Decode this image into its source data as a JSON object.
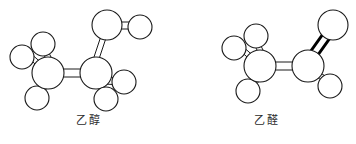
{
  "figure": {
    "background_color": "#ffffff",
    "line_color": "#1a1a1a",
    "atom_fill_color": "#ffffff",
    "bold_bond_color": "#000000",
    "width": 356,
    "height": 144
  },
  "molecules": [
    {
      "id": "ethanol",
      "caption": "乙醇",
      "formula": "CH3CH2OH",
      "model_type": "ball-and-stick",
      "atoms": [
        {
          "label": "H",
          "role": "methyl-hydrogen",
          "cx": 22,
          "cy": 57,
          "r": 12
        },
        {
          "label": "H",
          "role": "methyl-hydrogen",
          "cx": 43,
          "cy": 44,
          "r": 12
        },
        {
          "label": "H",
          "role": "methyl-hydrogen",
          "cx": 37,
          "cy": 98,
          "r": 12
        },
        {
          "label": "C",
          "role": "methyl-carbon",
          "cx": 48,
          "cy": 73,
          "r": 16
        },
        {
          "label": "C",
          "role": "methylene-carbon",
          "cx": 96,
          "cy": 73,
          "r": 16
        },
        {
          "label": "H",
          "role": "methylene-hydrogen",
          "cx": 124,
          "cy": 82,
          "r": 12
        },
        {
          "label": "H",
          "role": "methylene-hydrogen",
          "cx": 106,
          "cy": 99,
          "r": 12
        },
        {
          "label": "O",
          "role": "hydroxyl-oxygen",
          "cx": 107,
          "cy": 25,
          "r": 15
        },
        {
          "label": "H",
          "role": "hydroxyl-hydrogen",
          "cx": 140,
          "cy": 27,
          "r": 12
        }
      ],
      "bonds": [
        {
          "from": "methyl-carbon",
          "to": "methyl-hydrogen-1",
          "order": 1
        },
        {
          "from": "methyl-carbon",
          "to": "methyl-hydrogen-2",
          "order": 1
        },
        {
          "from": "methyl-carbon",
          "to": "methyl-hydrogen-3",
          "order": 1
        },
        {
          "from": "methyl-carbon",
          "to": "methylene-carbon",
          "order": 1
        },
        {
          "from": "methylene-carbon",
          "to": "methylene-hydrogen-1",
          "order": 1
        },
        {
          "from": "methylene-carbon",
          "to": "methylene-hydrogen-2",
          "order": 1
        },
        {
          "from": "methylene-carbon",
          "to": "hydroxyl-oxygen",
          "order": 1
        },
        {
          "from": "hydroxyl-oxygen",
          "to": "hydroxyl-hydrogen",
          "order": 1
        }
      ]
    },
    {
      "id": "acetaldehyde",
      "caption": "乙醛",
      "formula": "CH3CHO",
      "model_type": "ball-and-stick",
      "atoms": [
        {
          "label": "H",
          "role": "methyl-hydrogen",
          "cx": 56,
          "cy": 48,
          "r": 12
        },
        {
          "label": "H",
          "role": "methyl-hydrogen",
          "cx": 78,
          "cy": 36,
          "r": 12
        },
        {
          "label": "H",
          "role": "methyl-hydrogen",
          "cx": 70,
          "cy": 91,
          "r": 12
        },
        {
          "label": "C",
          "role": "methyl-carbon",
          "cx": 82,
          "cy": 66,
          "r": 16
        },
        {
          "label": "C",
          "role": "carbonyl-carbon",
          "cx": 130,
          "cy": 66,
          "r": 16
        },
        {
          "label": "H",
          "role": "aldehyde-hydrogen",
          "cx": 152,
          "cy": 86,
          "r": 12
        },
        {
          "label": "O",
          "role": "carbonyl-oxygen",
          "cx": 155,
          "cy": 25,
          "r": 15
        }
      ],
      "bonds": [
        {
          "from": "methyl-carbon",
          "to": "methyl-hydrogen-1",
          "order": 1
        },
        {
          "from": "methyl-carbon",
          "to": "methyl-hydrogen-2",
          "order": 1
        },
        {
          "from": "methyl-carbon",
          "to": "methyl-hydrogen-3",
          "order": 1
        },
        {
          "from": "methyl-carbon",
          "to": "carbonyl-carbon",
          "order": 1
        },
        {
          "from": "carbonyl-carbon",
          "to": "aldehyde-hydrogen",
          "order": 1
        },
        {
          "from": "carbonyl-carbon",
          "to": "carbonyl-oxygen",
          "order": 2,
          "style": "bold"
        }
      ]
    }
  ]
}
